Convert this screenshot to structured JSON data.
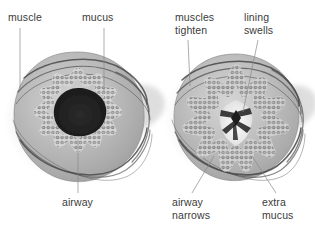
{
  "figure": {
    "background_color": "#ffffff",
    "label_color": "#3b3b3b",
    "leader_line_color": "#8a8a8a",
    "style": "grayscale medical illustration"
  },
  "labels": {
    "muscle": "muscle",
    "mucus": "mucus",
    "muscles_tighten": "muscles\ntighten",
    "lining_swells": "lining\nswells",
    "airway": "airway",
    "airway_narrows": "airway\nnarrows",
    "extra_mucus": "extra\nmucus"
  },
  "panels": [
    {
      "id": "normal-airway",
      "name": "normal airway cross-section",
      "side": "left",
      "center": [
        78,
        118
      ],
      "lumen": "wide open dark lumen",
      "labels": [
        "muscle",
        "mucus",
        "airway"
      ]
    },
    {
      "id": "asthmatic-airway",
      "name": "constricted asthmatic airway cross-section",
      "side": "right",
      "center": [
        236,
        118
      ],
      "lumen": "narrowed star-shaped lumen filled with pale mucus",
      "labels": [
        "muscles tighten",
        "lining swells",
        "airway narrows",
        "extra mucus"
      ]
    }
  ],
  "anatomy": {
    "smooth_muscle": "dark banded rings wrapping the outer wall",
    "epithelium": "beaded double row of cells lining the lumen",
    "submucosa": "light gray tissue mass between muscle and lining",
    "mucus_plug": "pale whitish material at the center of the right lumen"
  }
}
